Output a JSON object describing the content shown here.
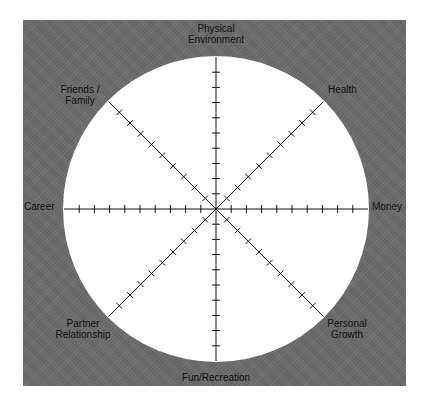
{
  "diagram": {
    "type": "wheel-of-life",
    "colors": {
      "panel_background": "#6b6b6b",
      "circle_fill": "#ffffff",
      "spoke_color": "#111111",
      "label_color": "#111111"
    },
    "scale": {
      "ticks_per_spoke": 10
    },
    "labels": {
      "physical_environment_line1": "Physical",
      "physical_environment_line2": "Environment",
      "health": "Health",
      "money": "Money",
      "personal_growth_line1": "Personal",
      "personal_growth_line2": "Growth",
      "fun_recreation": "Fun/Recreation",
      "partner_relationship_line1": "Partner",
      "partner_relationship_line2": "Relationship",
      "career": "Career",
      "friends_family_line1": "Friends /",
      "friends_family_line2": "Family"
    },
    "categories": [
      "Physical Environment",
      "Health",
      "Money",
      "Personal Growth",
      "Fun/Recreation",
      "Partner Relationship",
      "Career",
      "Friends / Family"
    ]
  }
}
